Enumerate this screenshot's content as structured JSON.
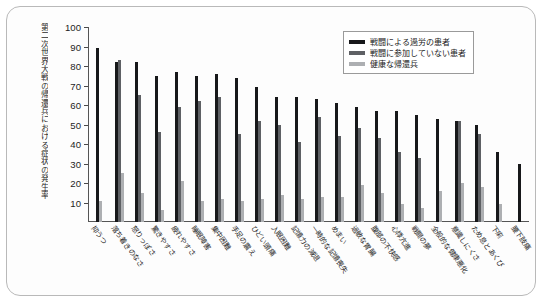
{
  "chart_data": {
    "type": "bar",
    "title": "",
    "ylabel": "第二次世界大戦の帰還兵における症状の発生率",
    "xlabel": "",
    "ylim": [
      0,
      100
    ],
    "yticks": [
      100,
      90,
      80,
      70,
      60,
      50,
      40,
      30,
      20,
      10
    ],
    "grid": false,
    "legend_position": "top-right",
    "categories": [
      "抑うつ",
      "落ち着きのなさ",
      "怒りっぽさ",
      "驚きやすさ",
      "疲れやすさ",
      "睡眠障害",
      "集中困難",
      "手足の震え",
      "ひどい頭痛",
      "入眠困難",
      "記憶力の減退",
      "一時的な記憶喪失",
      "めまい",
      "過敏な胃腸",
      "腹部の不快感",
      "心悸亢進",
      "戦闘の夢",
      "全般的な健康悪化",
      "意識しにくさ",
      "ため息とあくび",
      "下痢",
      "腰下肢痛"
    ],
    "series": [
      {
        "name": "戦闘による過労の患者",
        "color": "#17181a",
        "values": [
          89,
          82,
          82,
          75,
          77,
          75,
          76,
          74,
          69,
          64,
          64,
          63,
          61,
          59,
          57,
          57,
          55,
          53,
          52,
          50,
          36,
          30
        ]
      },
      {
        "name": "戦闘に参加していない患者",
        "color": "#5e6064",
        "values": [
          0,
          83,
          65,
          46,
          59,
          62,
          64,
          45,
          52,
          50,
          41,
          54,
          44,
          48,
          43,
          36,
          33,
          0,
          52,
          45,
          0,
          0
        ]
      },
      {
        "name": "健康な帰還兵",
        "color": "#adafb2",
        "values": [
          11,
          25,
          15,
          6,
          21,
          11,
          12,
          11,
          12,
          14,
          12,
          13,
          13,
          19,
          15,
          9,
          7,
          16,
          20,
          18,
          9,
          0
        ]
      }
    ]
  },
  "legend": {
    "items": [
      {
        "label": "戦闘による過労の患者"
      },
      {
        "label": "戦闘に参加していない患者"
      },
      {
        "label": "健康な帰還兵"
      }
    ]
  }
}
